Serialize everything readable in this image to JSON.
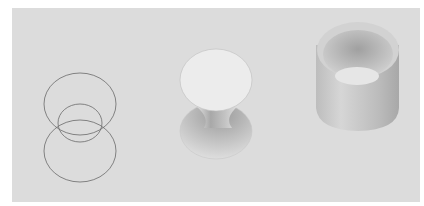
{
  "figure": {
    "panels": [
      {
        "name": "wireframe-circles",
        "description": "Three outlined circles: top, small middle, bottom"
      },
      {
        "name": "hyperboloid-surface",
        "description": "Shaded hourglass surface between two circular caps"
      },
      {
        "name": "cylinder-tube",
        "description": "Shaded hollow cylindrical tube"
      }
    ],
    "colors": {
      "background": "#dcdcdc",
      "border": "#ffffff",
      "stroke": "#6a6a6a",
      "cap": "#ececec",
      "shade_dark": "#8a8a8a",
      "shade_mid": "#b8b8b8",
      "shade_light": "#e4e4e4"
    }
  }
}
